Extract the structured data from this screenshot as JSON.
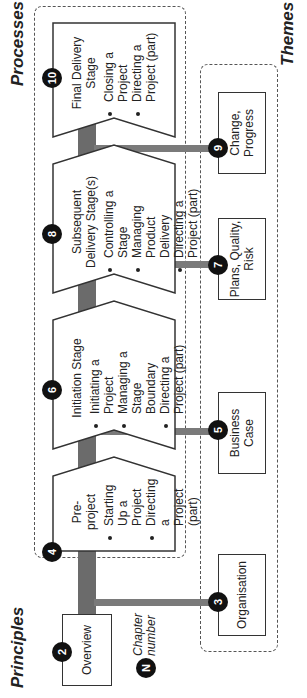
{
  "sections": {
    "principles": "Principles",
    "processes": "Processes",
    "themes": "Themes"
  },
  "legend": {
    "symbol": "N",
    "label_line1": "Chapter",
    "label_line2": "number"
  },
  "principles": [
    {
      "chapter": "2",
      "label": "Overview"
    }
  ],
  "processes": [
    {
      "chapter": "4",
      "title": "Pre-project",
      "items": [
        "Starting Up a Project",
        "Directing a Project (part)"
      ]
    },
    {
      "chapter": "6",
      "title": "Initiation Stage",
      "items": [
        "Initiating a Project",
        "Managing a Stage Boundary",
        "Directing a Project (part)"
      ]
    },
    {
      "chapter": "8",
      "title": "Subsequent Delivery Stage(s)",
      "items": [
        "Controlling a Stage",
        "Managing Product Delivery",
        "Directing a Project (part)"
      ]
    },
    {
      "chapter": "10",
      "title": "Final Delivery Stage",
      "items": [
        "Closing a Project",
        "Directing a Project (part)"
      ]
    }
  ],
  "themes": [
    {
      "chapter": "3",
      "label": "Organisation"
    },
    {
      "chapter": "5",
      "label": "Business Case"
    },
    {
      "chapter": "7",
      "label": "Plans, Quality, Risk"
    },
    {
      "chapter": "9",
      "label": "Change, Progress"
    }
  ],
  "colors": {
    "connector": "#6b6b6b",
    "badge": "#111111",
    "border": "#333333"
  }
}
